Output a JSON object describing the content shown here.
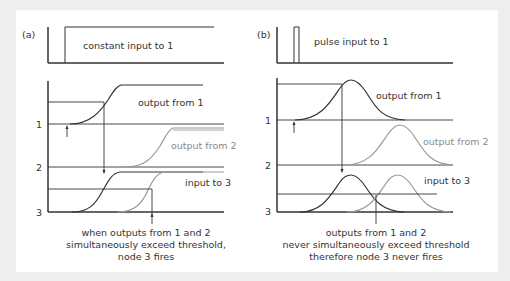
{
  "panel_a": {
    "label": "(a)",
    "top": {
      "caption": "constant input to 1"
    },
    "bottom": {
      "y_ticks": [
        "1",
        "2",
        "3"
      ],
      "labels": {
        "output1": "output from 1",
        "output2": "output from 2",
        "input3": "input to 3"
      },
      "caption": [
        "when outputs from 1 and 2",
        "simultaneously exceed threshold,",
        "node 3 fires"
      ]
    }
  },
  "panel_b": {
    "label": "(b)",
    "top": {
      "caption": "pulse input to 1"
    },
    "bottom": {
      "y_ticks": [
        "1",
        "2",
        "3"
      ],
      "labels": {
        "output1": "output from 1",
        "output2": "output from 2",
        "input3": "input to 3"
      },
      "caption": [
        "outputs from 1 and 2",
        "never simultaneously exceed threshold",
        "therefore node 3 never fires"
      ]
    }
  },
  "colors": {
    "dark_line": "#333333",
    "gray_line": "#9a9a9a",
    "background": "#eeeeee",
    "panel": "#ffffff"
  }
}
